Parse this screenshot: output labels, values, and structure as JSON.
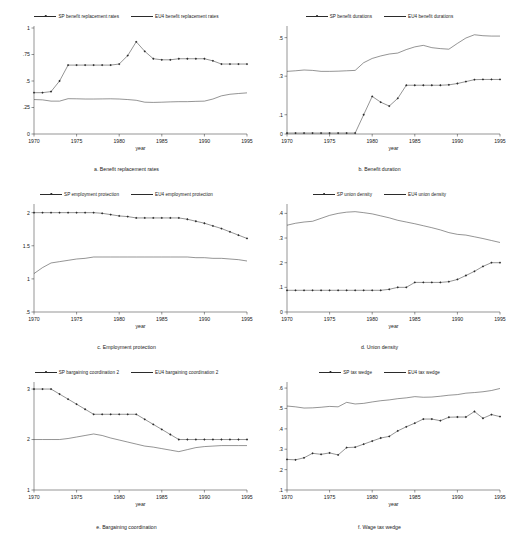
{
  "figure": {
    "title": "",
    "xlabel": "year",
    "xticks": [
      1970,
      1975,
      1980,
      1985,
      1990,
      1995
    ],
    "xlim": [
      1970,
      1995
    ]
  },
  "panels": [
    {
      "id": "a",
      "caption": "a. Benefit replacement rates",
      "legend": [
        {
          "label": "SP benefit replacement rates",
          "marker": true
        },
        {
          "label": "EU4 benefit replacement rates",
          "marker": false
        }
      ],
      "chart_data": {
        "type": "line",
        "title": "a. Benefit replacement rates",
        "xlabel": "year",
        "ylabel": "",
        "xlim": [
          1970,
          1995
        ],
        "ylim": [
          0,
          1
        ],
        "yticks": [
          0,
          0.25,
          0.5,
          0.75,
          1
        ],
        "ytick_labels": [
          "0",
          ".25",
          ".5",
          ".75",
          "1"
        ],
        "grid": false,
        "legend_position": "top",
        "x": [
          1970,
          1971,
          1972,
          1973,
          1974,
          1975,
          1976,
          1977,
          1978,
          1979,
          1980,
          1981,
          1982,
          1983,
          1984,
          1985,
          1986,
          1987,
          1988,
          1989,
          1990,
          1991,
          1992,
          1993,
          1994,
          1995
        ],
        "series": [
          {
            "name": "SP benefit replacement rates",
            "marker": true,
            "values": [
              0.39,
              0.39,
              0.4,
              0.5,
              0.65,
              0.65,
              0.65,
              0.65,
              0.65,
              0.65,
              0.66,
              0.74,
              0.87,
              0.78,
              0.71,
              0.7,
              0.7,
              0.71,
              0.71,
              0.71,
              0.71,
              0.69,
              0.66,
              0.66,
              0.66,
              0.66
            ]
          },
          {
            "name": "EU4 benefit replacement rates",
            "marker": false,
            "values": [
              0.325,
              0.322,
              0.31,
              0.31,
              0.333,
              0.332,
              0.33,
              0.33,
              0.331,
              0.332,
              0.33,
              0.325,
              0.318,
              0.3,
              0.298,
              0.3,
              0.303,
              0.305,
              0.305,
              0.308,
              0.31,
              0.33,
              0.36,
              0.375,
              0.382,
              0.388
            ]
          }
        ]
      }
    },
    {
      "id": "b",
      "caption": "b. Benefit duration",
      "legend": [
        {
          "label": "SP benefit durations",
          "marker": true
        },
        {
          "label": "EU4 benefit durations",
          "marker": false
        }
      ],
      "chart_data": {
        "type": "line",
        "title": "b. Benefit duration",
        "xlabel": "year",
        "ylabel": "",
        "xlim": [
          1970,
          1995
        ],
        "ylim": [
          0,
          0.55
        ],
        "yticks": [
          0,
          0.1,
          0.3,
          0.5
        ],
        "ytick_labels": [
          "0",
          ".1",
          ".3",
          ".5"
        ],
        "grid": false,
        "legend_position": "top",
        "x": [
          1970,
          1971,
          1972,
          1973,
          1974,
          1975,
          1976,
          1977,
          1978,
          1979,
          1980,
          1981,
          1982,
          1983,
          1984,
          1985,
          1986,
          1987,
          1988,
          1989,
          1990,
          1991,
          1992,
          1993,
          1994,
          1995
        ],
        "series": [
          {
            "name": "SP benefit durations",
            "marker": true,
            "values": [
              0.005,
              0.005,
              0.005,
              0.005,
              0.005,
              0.005,
              0.005,
              0.005,
              0.005,
              0.1,
              0.195,
              0.165,
              0.145,
              0.185,
              0.253,
              0.253,
              0.253,
              0.253,
              0.253,
              0.255,
              0.262,
              0.272,
              0.282,
              0.283,
              0.283,
              0.283
            ]
          },
          {
            "name": "EU4 benefit durations",
            "marker": false,
            "values": [
              0.325,
              0.328,
              0.332,
              0.33,
              0.325,
              0.325,
              0.326,
              0.328,
              0.33,
              0.37,
              0.392,
              0.405,
              0.415,
              0.42,
              0.438,
              0.452,
              0.46,
              0.448,
              0.443,
              0.44,
              0.47,
              0.498,
              0.515,
              0.51,
              0.508,
              0.508
            ]
          }
        ]
      }
    },
    {
      "id": "c",
      "caption": "c. Employment protection",
      "legend": [
        {
          "label": "SP employment protection",
          "marker": true
        },
        {
          "label": "EU4 employment protection",
          "marker": false
        }
      ],
      "chart_data": {
        "type": "line",
        "title": "c. Employment protection",
        "xlabel": "year",
        "ylabel": "",
        "xlim": [
          1970,
          1995
        ],
        "ylim": [
          0.5,
          2.1
        ],
        "yticks": [
          0.5,
          1,
          1.5,
          2
        ],
        "ytick_labels": [
          ".5",
          "1",
          "1.5",
          "2"
        ],
        "grid": false,
        "legend_position": "top",
        "x": [
          1970,
          1971,
          1972,
          1973,
          1974,
          1975,
          1976,
          1977,
          1978,
          1979,
          1980,
          1981,
          1982,
          1983,
          1984,
          1985,
          1986,
          1987,
          1988,
          1989,
          1990,
          1991,
          1992,
          1993,
          1994,
          1995
        ],
        "series": [
          {
            "name": "SP employment protection",
            "marker": true,
            "values": [
              2.0,
              2.0,
              2.0,
              2.0,
              2.0,
              2.0,
              2.0,
              2.0,
              1.99,
              1.97,
              1.95,
              1.94,
              1.92,
              1.92,
              1.92,
              1.92,
              1.92,
              1.92,
              1.9,
              1.87,
              1.84,
              1.8,
              1.76,
              1.71,
              1.66,
              1.61
            ]
          },
          {
            "name": "EU4 employment protection",
            "marker": false,
            "values": [
              1.08,
              1.17,
              1.24,
              1.26,
              1.28,
              1.3,
              1.31,
              1.33,
              1.33,
              1.33,
              1.33,
              1.33,
              1.33,
              1.33,
              1.33,
              1.33,
              1.33,
              1.33,
              1.33,
              1.32,
              1.32,
              1.31,
              1.31,
              1.3,
              1.29,
              1.27
            ]
          }
        ]
      }
    },
    {
      "id": "d",
      "caption": "d. Union density",
      "legend": [
        {
          "label": "SP union density",
          "marker": true
        },
        {
          "label": "EU4 union density",
          "marker": false
        }
      ],
      "chart_data": {
        "type": "line",
        "title": "d. Union density",
        "xlabel": "year",
        "ylabel": "",
        "xlim": [
          1970,
          1995
        ],
        "ylim": [
          0,
          0.43
        ],
        "yticks": [
          0,
          0.1,
          0.2,
          0.3,
          0.4
        ],
        "ytick_labels": [
          "0",
          ".1",
          ".2",
          ".3",
          ".4"
        ],
        "grid": false,
        "legend_position": "top",
        "x": [
          1970,
          1971,
          1972,
          1973,
          1974,
          1975,
          1976,
          1977,
          1978,
          1979,
          1980,
          1981,
          1982,
          1983,
          1984,
          1985,
          1986,
          1987,
          1988,
          1989,
          1990,
          1991,
          1992,
          1993,
          1994,
          1995
        ],
        "series": [
          {
            "name": "SP union density",
            "marker": true,
            "values": [
              0.088,
              0.088,
              0.088,
              0.088,
              0.088,
              0.088,
              0.088,
              0.088,
              0.088,
              0.088,
              0.088,
              0.088,
              0.092,
              0.1,
              0.1,
              0.12,
              0.12,
              0.12,
              0.12,
              0.123,
              0.132,
              0.148,
              0.165,
              0.185,
              0.2,
              0.2
            ]
          },
          {
            "name": "EU4 union density",
            "marker": false,
            "values": [
              0.352,
              0.36,
              0.365,
              0.368,
              0.38,
              0.392,
              0.4,
              0.405,
              0.407,
              0.403,
              0.398,
              0.39,
              0.382,
              0.372,
              0.365,
              0.358,
              0.35,
              0.342,
              0.333,
              0.322,
              0.315,
              0.312,
              0.305,
              0.298,
              0.29,
              0.282
            ]
          }
        ]
      }
    },
    {
      "id": "e",
      "caption": "e. Bargaining coordination",
      "legend": [
        {
          "label": "SP bargaining coordination 2",
          "marker": true
        },
        {
          "label": "EU4 bargaining coordination 2",
          "marker": false
        }
      ],
      "chart_data": {
        "type": "line",
        "title": "e. Bargaining coordination",
        "xlabel": "year",
        "ylabel": "",
        "xlim": [
          1970,
          1995
        ],
        "ylim": [
          1,
          3.1
        ],
        "yticks": [
          1,
          2,
          3
        ],
        "ytick_labels": [
          "1",
          "2",
          "3"
        ],
        "grid": false,
        "legend_position": "top",
        "x": [
          1970,
          1971,
          1972,
          1973,
          1974,
          1975,
          1976,
          1977,
          1978,
          1979,
          1980,
          1981,
          1982,
          1983,
          1984,
          1985,
          1986,
          1987,
          1988,
          1989,
          1990,
          1991,
          1992,
          1993,
          1994,
          1995
        ],
        "series": [
          {
            "name": "SP bargaining coordination 2",
            "marker": true,
            "values": [
              3.0,
              3.0,
              3.0,
              2.9,
              2.8,
              2.7,
              2.6,
              2.5,
              2.5,
              2.5,
              2.5,
              2.5,
              2.5,
              2.4,
              2.3,
              2.2,
              2.1,
              2.0,
              2.0,
              2.0,
              2.0,
              2.0,
              2.0,
              2.0,
              2.0,
              2.0
            ]
          },
          {
            "name": "EU4 bargaining coordination 2",
            "marker": false,
            "values": [
              2.0,
              2.0,
              2.0,
              2.0,
              2.02,
              2.05,
              2.08,
              2.11,
              2.08,
              2.03,
              1.99,
              1.95,
              1.91,
              1.87,
              1.85,
              1.82,
              1.79,
              1.76,
              1.8,
              1.84,
              1.86,
              1.87,
              1.88,
              1.88,
              1.88,
              1.88
            ]
          }
        ]
      }
    },
    {
      "id": "f",
      "caption": "f. Wage tax wedge",
      "legend": [
        {
          "label": "SP tax wedge",
          "marker": true
        },
        {
          "label": "EU4 tax wedge",
          "marker": false
        }
      ],
      "chart_data": {
        "type": "line",
        "title": "f. Wage tax wedge",
        "xlabel": "year",
        "ylabel": "",
        "xlim": [
          1970,
          1995
        ],
        "ylim": [
          0.1,
          0.62
        ],
        "yticks": [
          0.1,
          0.2,
          0.3,
          0.4,
          0.5,
          0.6
        ],
        "ytick_labels": [
          ".1",
          ".2",
          ".3",
          ".4",
          ".5",
          ".6"
        ],
        "grid": false,
        "legend_position": "top",
        "x": [
          1970,
          1971,
          1972,
          1973,
          1974,
          1975,
          1976,
          1977,
          1978,
          1979,
          1980,
          1981,
          1982,
          1983,
          1984,
          1985,
          1986,
          1987,
          1988,
          1989,
          1990,
          1991,
          1992,
          1993,
          1994,
          1995
        ],
        "series": [
          {
            "name": "SP tax wedge",
            "marker": true,
            "values": [
              0.25,
              0.248,
              0.258,
              0.28,
              0.275,
              0.282,
              0.272,
              0.308,
              0.31,
              0.325,
              0.34,
              0.355,
              0.363,
              0.39,
              0.41,
              0.428,
              0.448,
              0.448,
              0.44,
              0.457,
              0.458,
              0.458,
              0.485,
              0.452,
              0.47,
              0.46
            ]
          },
          {
            "name": "EU4 tax wedge",
            "marker": false,
            "values": [
              0.512,
              0.508,
              0.502,
              0.503,
              0.506,
              0.51,
              0.508,
              0.53,
              0.522,
              0.525,
              0.532,
              0.538,
              0.542,
              0.548,
              0.552,
              0.558,
              0.555,
              0.556,
              0.56,
              0.565,
              0.568,
              0.575,
              0.578,
              0.582,
              0.588,
              0.598
            ]
          }
        ]
      }
    }
  ]
}
